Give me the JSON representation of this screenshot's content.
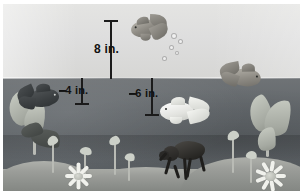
{
  "figure": {
    "waterline_label": "water surface",
    "colors": {
      "air": "#dedede",
      "water": "#63686c",
      "sand": "#9a9c97",
      "annotation": "#1b1b1b"
    }
  },
  "measurements": [
    {
      "id": "above-water",
      "label": "8 in.",
      "value": 8,
      "unit": "in.",
      "sign": "positive",
      "region": "above-water"
    },
    {
      "id": "depth-4",
      "label": "–4 in.",
      "value": -4,
      "unit": "in.",
      "sign": "negative",
      "region": "below-water"
    },
    {
      "id": "depth-6",
      "label": "–6 in.",
      "value": -6,
      "unit": "in.",
      "sign": "negative",
      "region": "below-water"
    }
  ],
  "scene_objects": {
    "fish": [
      {
        "name": "jumping-goldfish",
        "position": "above-water-center"
      },
      {
        "name": "surface-goldfish",
        "position": "waterline-right"
      },
      {
        "name": "dark-fish",
        "position": "upper-left-underwater"
      },
      {
        "name": "white-fish",
        "position": "mid-right-underwater"
      }
    ],
    "beetle": {
      "name": "water-beetle",
      "position": "sand-bed-center"
    },
    "flowers": [
      {
        "name": "flower-left",
        "position": "sand-bed-left"
      },
      {
        "name": "flower-right",
        "position": "sand-bed-right"
      }
    ],
    "plants": [
      {
        "name": "plant-left-dark",
        "position": "lower-left"
      },
      {
        "name": "plant-right-broad",
        "position": "lower-right"
      },
      {
        "name": "bud-stems",
        "count": 6
      }
    ],
    "bubbles": {
      "name": "air-bubbles",
      "count": 5
    }
  }
}
